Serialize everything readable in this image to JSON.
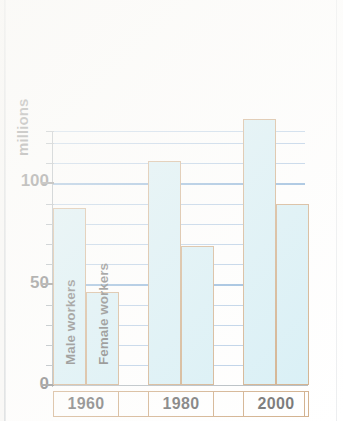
{
  "chart_data": {
    "type": "bar",
    "title": "",
    "subtitle": "",
    "xlabel": "",
    "ylabel": "millions",
    "categories": [
      "1960",
      "1980",
      "2000"
    ],
    "series": [
      {
        "name": "Male workers",
        "values": [
          88,
          111,
          132
        ]
      },
      {
        "name": "Female workers",
        "values": [
          46,
          69,
          90
        ]
      }
    ],
    "ylim": [
      0,
      126
    ],
    "yticks": [
      0,
      50,
      100
    ],
    "ytick_labels": [
      "0",
      "50",
      "100"
    ],
    "minor_tick_step": 10,
    "grid": true,
    "grid_major_values": [
      50,
      100
    ],
    "legend": "in-bar",
    "legend_note": "Series names are printed vertically inside the 1960 bars",
    "colors": {
      "bar_fill": "#bde5f0",
      "bar_border": "#b2793d",
      "gridline": "#7ea8d4",
      "gridline_major": "#3d7fc1",
      "axis": "#6f7d88",
      "text": "#111111",
      "xbox_border": "#b2793d",
      "background": "#ffffff"
    }
  },
  "axis": {
    "y_label": "millions",
    "ticks": [
      {
        "value": 100,
        "label": "100"
      },
      {
        "value": 50,
        "label": "50"
      },
      {
        "value": 0,
        "label": "0"
      }
    ]
  },
  "bars": {
    "g1960": {
      "category": "1960",
      "male": {
        "label": "Male workers",
        "value": 88
      },
      "female": {
        "label": "Female workers",
        "value": 46
      }
    },
    "g1980": {
      "category": "1980",
      "male": {
        "label": "Male workers",
        "value": 111
      },
      "female": {
        "label": "Female workers",
        "value": 69
      }
    },
    "g2000": {
      "category": "2000",
      "male": {
        "label": "Male workers",
        "value": 132
      },
      "female": {
        "label": "Female workers",
        "value": 90
      }
    }
  }
}
